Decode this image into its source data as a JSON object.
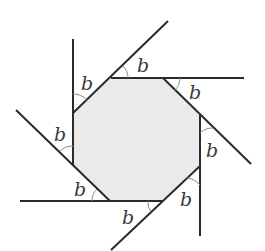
{
  "diagram": {
    "type": "geometry",
    "title": "",
    "shape": "regular-octagon",
    "fill_color": "#eaeaea",
    "line_color": "#2b2b2b",
    "arc_color": "#8a8a8a",
    "angle_symbol": "b",
    "octagon_vertices": [
      [
        111,
        78
      ],
      [
        163,
        78
      ],
      [
        200,
        115
      ],
      [
        200,
        166
      ],
      [
        162,
        201
      ],
      [
        110,
        201
      ],
      [
        73,
        165
      ],
      [
        73,
        113
      ]
    ],
    "extended_lines": [
      {
        "name": "left-vertical",
        "from": [
          73,
          39
        ],
        "to": [
          73,
          113
        ]
      },
      {
        "name": "top-left-diagonal",
        "from": [
          73,
          113
        ],
        "to": [
          168,
          21
        ]
      },
      {
        "name": "top-horizontal",
        "from": [
          111,
          78
        ],
        "to": [
          244,
          78
        ]
      },
      {
        "name": "top-right-diagonal",
        "from": [
          163,
          78
        ],
        "to": [
          251,
          164
        ]
      },
      {
        "name": "right-vertical",
        "from": [
          200,
          115
        ],
        "to": [
          200,
          236
        ]
      },
      {
        "name": "bottom-right-diagonal",
        "from": [
          200,
          166
        ],
        "to": [
          111,
          250
        ]
      },
      {
        "name": "bottom-horizontal",
        "from": [
          20,
          201
        ],
        "to": [
          162,
          201
        ]
      },
      {
        "name": "bottom-left-diagonal",
        "from": [
          16,
          110
        ],
        "to": [
          110,
          201
        ]
      }
    ],
    "angles": [
      {
        "position": "top-left",
        "label": "b",
        "x": 81,
        "y": 90
      },
      {
        "position": "top",
        "label": "b",
        "x": 137,
        "y": 72
      },
      {
        "position": "top-right",
        "label": "b",
        "x": 189,
        "y": 99
      },
      {
        "position": "right",
        "label": "b",
        "x": 206,
        "y": 157
      },
      {
        "position": "bottom-right",
        "label": "b",
        "x": 180,
        "y": 206
      },
      {
        "position": "bottom",
        "label": "b",
        "x": 122,
        "y": 224
      },
      {
        "position": "bottom-left",
        "label": "b",
        "x": 74,
        "y": 196
      },
      {
        "position": "left",
        "label": "b",
        "x": 54,
        "y": 141
      }
    ]
  }
}
